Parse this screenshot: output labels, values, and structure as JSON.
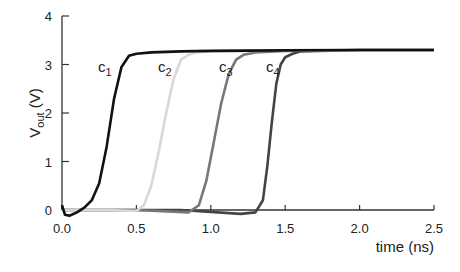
{
  "chart_data": {
    "type": "line",
    "title": "",
    "xlabel": "time (ns)",
    "ylabel": "V_out (V)",
    "ylabel_main": "V",
    "ylabel_sub": "out",
    "ylabel_unit": " (V)",
    "xlim": [
      0.0,
      2.5
    ],
    "ylim": [
      0,
      4
    ],
    "grid": false,
    "legend_position": "inline labels near curves",
    "xticks": [
      "0.0",
      "0.5",
      "1.0",
      "1.5",
      "2.0",
      "2.5"
    ],
    "yticks": [
      "0",
      "1",
      "2",
      "3",
      "4"
    ],
    "series": [
      {
        "name": "c1",
        "label_main": "c",
        "label_sub": "1",
        "color": "#111111",
        "x": [
          0.0,
          0.02,
          0.05,
          0.1,
          0.15,
          0.2,
          0.25,
          0.3,
          0.35,
          0.4,
          0.45,
          0.5,
          0.6,
          0.8,
          1.0,
          1.5,
          2.0,
          2.5
        ],
        "y": [
          0.1,
          -0.1,
          -0.12,
          -0.05,
          0.05,
          0.2,
          0.55,
          1.3,
          2.3,
          2.95,
          3.18,
          3.22,
          3.25,
          3.27,
          3.28,
          3.29,
          3.3,
          3.3
        ]
      },
      {
        "name": "c2",
        "label_main": "c",
        "label_sub": "2",
        "color": "#d8d8d8",
        "x": [
          0.0,
          0.3,
          0.5,
          0.55,
          0.6,
          0.65,
          0.7,
          0.75,
          0.8,
          0.85,
          0.9,
          1.0,
          1.5,
          2.0,
          2.5
        ],
        "y": [
          0.0,
          0.0,
          -0.02,
          0.1,
          0.5,
          1.2,
          2.0,
          2.7,
          3.1,
          3.2,
          3.25,
          3.27,
          3.29,
          3.3,
          3.3
        ]
      },
      {
        "name": "c3",
        "label_main": "c",
        "label_sub": "3",
        "color": "#777777",
        "x": [
          0.0,
          0.5,
          0.85,
          0.92,
          0.97,
          1.02,
          1.07,
          1.12,
          1.17,
          1.22,
          1.3,
          1.5,
          2.0,
          2.5
        ],
        "y": [
          0.0,
          0.0,
          -0.05,
          0.1,
          0.6,
          1.4,
          2.2,
          2.8,
          3.1,
          3.2,
          3.25,
          3.28,
          3.3,
          3.3
        ]
      },
      {
        "name": "c4",
        "label_main": "c",
        "label_sub": "4",
        "color": "#444444",
        "x": [
          0.0,
          0.8,
          1.2,
          1.3,
          1.35,
          1.38,
          1.41,
          1.44,
          1.47,
          1.5,
          1.55,
          1.6,
          2.0,
          2.5
        ],
        "y": [
          0.0,
          0.0,
          -0.08,
          -0.05,
          0.2,
          0.9,
          1.8,
          2.6,
          3.0,
          3.15,
          3.22,
          3.27,
          3.3,
          3.3
        ]
      }
    ]
  }
}
